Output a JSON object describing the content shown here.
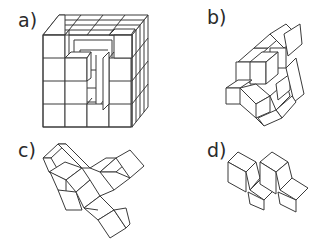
{
  "figure": {
    "panels": [
      {
        "id": "a",
        "label": "a)",
        "content": "4x4x4 cube of unit cubes with top center removed (hollow interior visible)"
      },
      {
        "id": "b",
        "label": "b)",
        "content": "polycube piece, diagonal stacked arrangement"
      },
      {
        "id": "c",
        "label": "c)",
        "content": "polycube piece, V-shaped arrangement"
      },
      {
        "id": "d",
        "label": "d)",
        "content": "polycube piece, small zig-zag arrangement"
      }
    ]
  },
  "colors": {
    "line": "#3a3a3a",
    "face": "#ffffff",
    "background": "#ffffff",
    "text": "#2a2a2a"
  }
}
